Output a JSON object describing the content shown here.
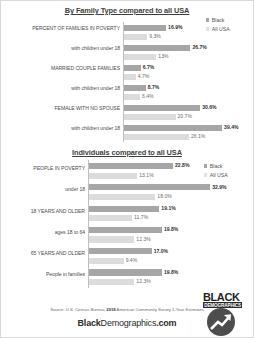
{
  "footer": {
    "source_prefix": "Source: U.S. Census Bureau, ",
    "source_year": "2018",
    "source_suffix": " American Community Survey 1-Year Estimates",
    "brand_part1": "Black",
    "brand_part2": "Demographics",
    "brand_part3": ".com",
    "logo_title": "BLACK",
    "logo_subtitle": "DEMOGRAPHICS"
  },
  "legend": {
    "black": "Black",
    "all_usa": "All USA"
  },
  "chart_data": [
    {
      "type": "bar",
      "title": "By Family Type compared to all USA",
      "orientation": "horizontal",
      "xlabel": "",
      "ylabel": "",
      "xlim": [
        0,
        45
      ],
      "grid": false,
      "legend_position": "top-right",
      "categories": [
        "PERCENT OF FAMILIES IN POVERTY",
        "with children under 18",
        "MARRIED COUPLE FAMILIES",
        "with children under 18",
        "FEMALE WITH NO SPOUSE",
        "with children under 18"
      ],
      "series": [
        {
          "name": "Black",
          "color": "#a6a6a6",
          "values": [
            16.9,
            26.7,
            6.7,
            8.7,
            30.6,
            39.4
          ],
          "labels": [
            "16.9%",
            "26.7%",
            "6.7%",
            "8.7%",
            "30.6%",
            "39.4%"
          ]
        },
        {
          "name": "All USA",
          "color": "#dcdcdc",
          "values": [
            9.3,
            13.0,
            4.7,
            6.4,
            20.7,
            26.1
          ],
          "labels": [
            "9.3%",
            "13%",
            "4.7%",
            "6.4%",
            "20.7%",
            "26.1%"
          ]
        }
      ]
    },
    {
      "type": "bar",
      "title": "Individuals compared to all USA",
      "orientation": "horizontal",
      "xlabel": "",
      "ylabel": "",
      "xlim": [
        0,
        38
      ],
      "grid": false,
      "legend_position": "top-right",
      "categories": [
        "PEOPLE IN POVERTY",
        "under 18",
        "18 YEARS AND OLDER",
        "ages 18 to 64",
        "65 YEARS AND OLDER",
        "People in families"
      ],
      "series": [
        {
          "name": "Black",
          "color": "#a6a6a6",
          "values": [
            22.8,
            32.9,
            19.1,
            19.8,
            17.0,
            19.8
          ],
          "labels": [
            "22.8%",
            "32.9%",
            "19.1%",
            "19.8%",
            "17.0%",
            "19.8%"
          ]
        },
        {
          "name": "All USA",
          "color": "#dcdcdc",
          "values": [
            13.1,
            18.0,
            11.7,
            12.3,
            9.4,
            12.3
          ],
          "labels": [
            "13.1%",
            "18.0%",
            "11.7%",
            "12.3%",
            "9.4%",
            "12.3%"
          ]
        }
      ]
    }
  ]
}
